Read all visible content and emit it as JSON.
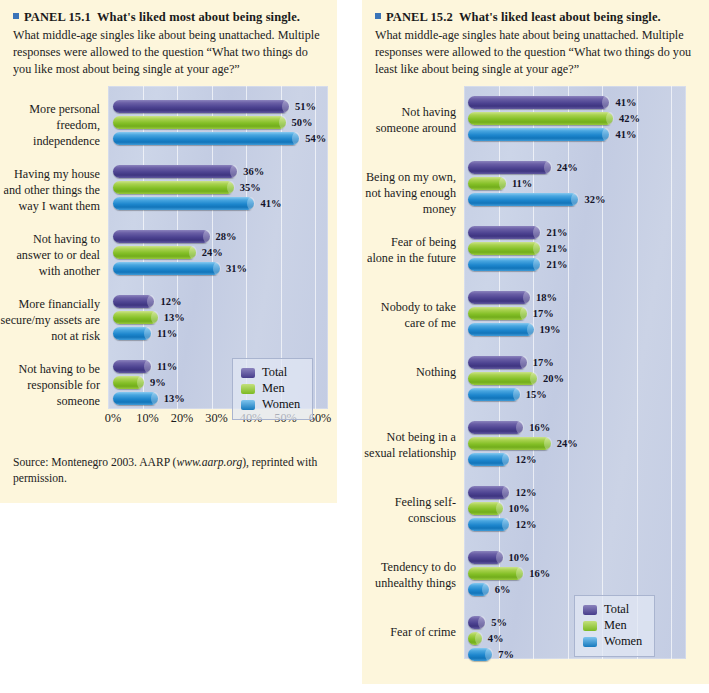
{
  "panels": [
    {
      "id": "panel-15-1",
      "marker": "square-marker",
      "label": "PANEL 15.1",
      "title": "What's liked most about being single.",
      "description": "What middle-age singles like about being unattached. Multiple responses were allowed to the question “What two things do you like most about being single at your age?”",
      "source_prefix": "Source: Montenegro 2003. AARP (",
      "source_url": "www.aarp.org",
      "source_suffix": "), reprinted with permission.",
      "chart_data": {
        "type": "bar",
        "orientation": "horizontal",
        "title": "What's liked most about being single.",
        "xlabel": "",
        "ylabel": "",
        "xlim": [
          0,
          60
        ],
        "xticks": [
          "0%",
          "10%",
          "20%",
          "30%",
          "40%",
          "50%",
          "60%"
        ],
        "xtick_values": [
          0,
          10,
          20,
          30,
          40,
          50,
          60
        ],
        "grid": true,
        "legend_position": "bottom-right",
        "categories": [
          "More personal freedom, independence",
          "Having my house and other things the way I want them",
          "Not having to answer to or deal with another",
          "More financially secure/my assets are not at risk",
          "Not having to be responsible for someone"
        ],
        "series": [
          {
            "name": "Total",
            "color": "#4d4391",
            "values": [
              51,
              36,
              28,
              12,
              11
            ]
          },
          {
            "name": "Men",
            "color": "#83bf26",
            "values": [
              50,
              35,
              24,
              13,
              9
            ]
          },
          {
            "name": "Women",
            "color": "#1d86cd",
            "values": [
              54,
              41,
              31,
              11,
              13
            ]
          }
        ],
        "value_labels": [
          [
            "51%",
            "50%",
            "54%"
          ],
          [
            "36%",
            "35%",
            "41%"
          ],
          [
            "28%",
            "24%",
            "31%"
          ],
          [
            "12%",
            "13%",
            "11%"
          ],
          [
            "11%",
            "9%",
            "13%"
          ]
        ]
      }
    },
    {
      "id": "panel-15-2",
      "marker": "square-marker",
      "label": "PANEL 15.2",
      "title": "What's liked least about being single.",
      "description": "What middle-age singles hate about being unattached. Multiple responses were allowed to the question “What two things do you least like about being single at your age?”",
      "chart_data": {
        "type": "bar",
        "orientation": "horizontal",
        "title": "What's liked least about being single.",
        "xlabel": "",
        "ylabel": "",
        "xlim": [
          0,
          60
        ],
        "xticks": [],
        "grid": true,
        "legend_position": "bottom-right",
        "categories": [
          "Not having someone around",
          "Being on my own, not having enough money",
          "Fear of being alone in the future",
          "Nobody to take care of me",
          "Nothing",
          "Not being in a sexual relationship",
          "Feeling self-conscious",
          "Tendency to do unhealthy things",
          "Fear of crime"
        ],
        "series": [
          {
            "name": "Total",
            "color": "#4d4391",
            "values": [
              41,
              24,
              21,
              18,
              17,
              16,
              12,
              10,
              5
            ]
          },
          {
            "name": "Men",
            "color": "#83bf26",
            "values": [
              42,
              11,
              21,
              17,
              20,
              24,
              10,
              16,
              4
            ]
          },
          {
            "name": "Women",
            "color": "#1d86cd",
            "values": [
              41,
              32,
              21,
              19,
              15,
              12,
              12,
              6,
              7
            ]
          }
        ],
        "value_labels": [
          [
            "41%",
            "42%",
            "41%"
          ],
          [
            "24%",
            "11%",
            "32%"
          ],
          [
            "21%",
            "21%",
            "21%"
          ],
          [
            "18%",
            "17%",
            "19%"
          ],
          [
            "17%",
            "20%",
            "15%"
          ],
          [
            "16%",
            "24%",
            "12%"
          ],
          [
            "12%",
            "10%",
            "12%"
          ],
          [
            "10%",
            "16%",
            "6%"
          ],
          [
            "5%",
            "4%",
            "7%"
          ]
        ]
      }
    }
  ],
  "legend": {
    "items": [
      {
        "label": "Total",
        "color": "#4d4391"
      },
      {
        "label": "Men",
        "color": "#83bf26"
      },
      {
        "label": "Women",
        "color": "#1d86cd"
      }
    ]
  }
}
